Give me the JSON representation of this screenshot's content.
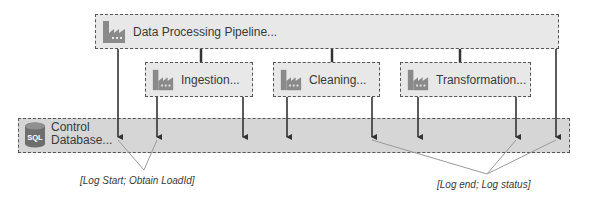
{
  "diagram": {
    "pipeline": {
      "label": "Data Processing Pipeline...",
      "icon": "factory-icon"
    },
    "activities": [
      {
        "label": "Ingestion...",
        "icon": "factory-icon"
      },
      {
        "label": "Cleaning...",
        "icon": "factory-icon"
      },
      {
        "label": "Transformation...",
        "icon": "factory-icon"
      }
    ],
    "control_database": {
      "line1": "Control",
      "line2": "Database...",
      "icon": "sql-database-icon",
      "icon_text": "SQL"
    },
    "callouts": {
      "start": "[Log Start; Obtain LoadId]",
      "end": "[Log end; Log status]"
    },
    "colors": {
      "box_fill": "#e8e8e8",
      "band_fill": "#d6d6d6",
      "border": "#555555",
      "arrow": "#333333",
      "callout_line": "#999999",
      "icon": "#8a8a8a"
    }
  }
}
